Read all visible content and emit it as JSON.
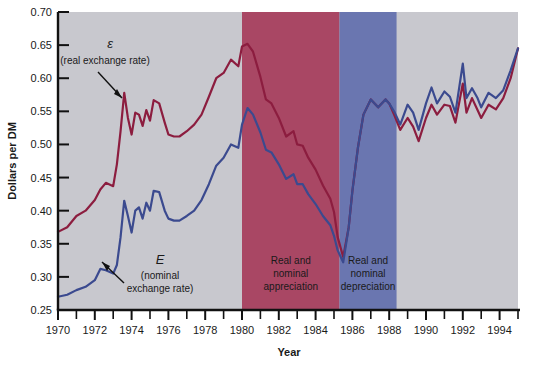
{
  "chart_data": {
    "type": "line",
    "title": "",
    "xlabel": "Year",
    "ylabel": "Dollars per DM",
    "xlim": [
      1970,
      1995
    ],
    "ylim": [
      0.25,
      0.7
    ],
    "grid": false,
    "legend_position": "inline-annotations",
    "ytick_labels": [
      "0.25",
      "0.30",
      "0.35",
      "0.40",
      "0.45",
      "0.50",
      "0.55",
      "0.60",
      "0.65",
      "0.70"
    ],
    "ytick_values": [
      0.25,
      0.3,
      0.35,
      0.4,
      0.45,
      0.5,
      0.55,
      0.6,
      0.65,
      0.7
    ],
    "xtick_labels": [
      "1970",
      "1972",
      "1974",
      "1976",
      "1978",
      "1980",
      "1982",
      "1984",
      "1986",
      "1988",
      "1990",
      "1992",
      "1994"
    ],
    "xtick_values": [
      1970,
      1972,
      1974,
      1976,
      1978,
      1980,
      1982,
      1984,
      1986,
      1988,
      1990,
      1992,
      1994
    ],
    "xtick_minor_values": [
      1971,
      1973,
      1975,
      1977,
      1979,
      1981,
      1983,
      1985,
      1987,
      1989,
      1991,
      1993,
      1995
    ],
    "series": [
      {
        "name": "real exchange rate",
        "symbol": "ε",
        "color": "#8c1d3f",
        "x": [
          1970.0,
          1970.5,
          1971.0,
          1971.5,
          1972.0,
          1972.3,
          1972.6,
          1973.0,
          1973.2,
          1973.4,
          1973.6,
          1973.8,
          1974.0,
          1974.2,
          1974.4,
          1974.6,
          1974.8,
          1975.0,
          1975.2,
          1975.5,
          1975.8,
          1976.0,
          1976.3,
          1976.6,
          1977.0,
          1977.4,
          1977.8,
          1978.2,
          1978.6,
          1979.0,
          1979.4,
          1979.8,
          1980.0,
          1980.3,
          1980.6,
          1981.0,
          1981.3,
          1981.6,
          1982.0,
          1982.4,
          1982.8,
          1983.0,
          1983.3,
          1983.6,
          1984.0,
          1984.4,
          1984.8,
          1985.0,
          1985.2,
          1985.5,
          1985.8,
          1986.0,
          1986.3,
          1986.6,
          1987.0,
          1987.4,
          1987.8,
          1988.0,
          1988.3,
          1988.6,
          1989.0,
          1989.3,
          1989.6,
          1990.0,
          1990.3,
          1990.6,
          1991.0,
          1991.3,
          1991.6,
          1992.0,
          1992.2,
          1992.5,
          1992.8,
          1993.0,
          1993.4,
          1993.8,
          1994.2,
          1994.6,
          1995.0
        ],
        "y": [
          0.368,
          0.375,
          0.392,
          0.4,
          0.416,
          0.432,
          0.442,
          0.437,
          0.47,
          0.52,
          0.578,
          0.54,
          0.515,
          0.548,
          0.545,
          0.528,
          0.552,
          0.536,
          0.567,
          0.562,
          0.533,
          0.515,
          0.512,
          0.512,
          0.52,
          0.53,
          0.545,
          0.572,
          0.6,
          0.608,
          0.628,
          0.618,
          0.648,
          0.652,
          0.64,
          0.602,
          0.568,
          0.562,
          0.54,
          0.512,
          0.52,
          0.5,
          0.498,
          0.48,
          0.462,
          0.438,
          0.418,
          0.398,
          0.36,
          0.33,
          0.375,
          0.43,
          0.495,
          0.545,
          0.568,
          0.556,
          0.568,
          0.562,
          0.543,
          0.522,
          0.54,
          0.527,
          0.505,
          0.54,
          0.56,
          0.545,
          0.56,
          0.558,
          0.533,
          0.592,
          0.548,
          0.57,
          0.552,
          0.54,
          0.56,
          0.553,
          0.57,
          0.6,
          0.645
        ]
      },
      {
        "name": "nominal exchange rate",
        "symbol": "E",
        "color": "#3b4a8f",
        "x": [
          1970.0,
          1970.5,
          1971.0,
          1971.5,
          1972.0,
          1972.3,
          1972.6,
          1973.0,
          1973.2,
          1973.4,
          1973.6,
          1973.8,
          1974.0,
          1974.2,
          1974.4,
          1974.6,
          1974.8,
          1975.0,
          1975.2,
          1975.5,
          1975.8,
          1976.0,
          1976.3,
          1976.6,
          1977.0,
          1977.4,
          1977.8,
          1978.2,
          1978.6,
          1979.0,
          1979.4,
          1979.8,
          1980.0,
          1980.3,
          1980.6,
          1981.0,
          1981.3,
          1981.6,
          1982.0,
          1982.4,
          1982.8,
          1983.0,
          1983.3,
          1983.6,
          1984.0,
          1984.4,
          1984.8,
          1985.0,
          1985.2,
          1985.5,
          1985.8,
          1986.0,
          1986.3,
          1986.6,
          1987.0,
          1987.4,
          1987.8,
          1988.0,
          1988.3,
          1988.6,
          1989.0,
          1989.3,
          1989.6,
          1990.0,
          1990.3,
          1990.6,
          1991.0,
          1991.3,
          1991.6,
          1992.0,
          1992.2,
          1992.5,
          1992.8,
          1993.0,
          1993.4,
          1993.8,
          1994.2,
          1994.6,
          1995.0
        ],
        "y": [
          0.27,
          0.273,
          0.28,
          0.285,
          0.295,
          0.312,
          0.31,
          0.305,
          0.318,
          0.36,
          0.415,
          0.392,
          0.367,
          0.4,
          0.405,
          0.388,
          0.412,
          0.4,
          0.43,
          0.428,
          0.4,
          0.388,
          0.385,
          0.385,
          0.392,
          0.4,
          0.416,
          0.44,
          0.468,
          0.48,
          0.5,
          0.495,
          0.53,
          0.555,
          0.545,
          0.518,
          0.492,
          0.488,
          0.47,
          0.448,
          0.455,
          0.44,
          0.44,
          0.425,
          0.41,
          0.392,
          0.378,
          0.362,
          0.34,
          0.322,
          0.375,
          0.43,
          0.495,
          0.545,
          0.568,
          0.556,
          0.568,
          0.562,
          0.548,
          0.53,
          0.56,
          0.548,
          0.522,
          0.562,
          0.586,
          0.562,
          0.58,
          0.572,
          0.548,
          0.622,
          0.57,
          0.585,
          0.57,
          0.556,
          0.578,
          0.57,
          0.582,
          0.612,
          0.645
        ]
      }
    ],
    "bands": [
      {
        "name": "appreciation",
        "label": "Real and\nnominal\nappreciation",
        "label_lines": [
          "Real and",
          "nominal",
          "appreciation"
        ],
        "start": 1980.0,
        "end": 1985.3,
        "color": "#a94764"
      },
      {
        "name": "depreciation",
        "label": "Real and\nnominal\ndepreciation",
        "label_lines": [
          "Real and",
          "nominal",
          "depreciation"
        ],
        "start": 1985.3,
        "end": 1988.4,
        "color": "#6a76b0"
      }
    ],
    "plot_background": "#c8c8ce",
    "annotations": [
      {
        "name": "real-rate-annotation",
        "symbol": "ε",
        "lines": [
          "(real exchange rate)"
        ]
      },
      {
        "name": "nominal-rate-annotation",
        "symbol": "E",
        "lines": [
          "(nominal",
          "exchange rate)"
        ]
      }
    ]
  }
}
